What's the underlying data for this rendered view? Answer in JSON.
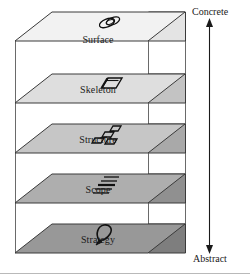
{
  "diagram": {
    "axis": {
      "top_label": "Concrete",
      "bottom_label": "Abstract",
      "name": "concrete-abstract-axis"
    },
    "layers": [
      {
        "id": "surface",
        "label": "Surface",
        "icon": "overlapping-rings-icon",
        "fill": "#f2f2f2",
        "label_x": 98,
        "label_y": 41
      },
      {
        "id": "skeleton",
        "label": "Skeleton",
        "icon": "wireframe-box-icon",
        "fill": "#dedede",
        "label_x": 98,
        "label_y": 91
      },
      {
        "id": "structure",
        "label": "Structure",
        "icon": "node-network-icon",
        "fill": "#c6c6c6",
        "label_x": 98,
        "label_y": 141
      },
      {
        "id": "scope",
        "label": "Scope",
        "icon": "feature-list-icon",
        "fill": "#aeaeae",
        "label_x": 98,
        "label_y": 191
      },
      {
        "id": "strategy",
        "label": "Strategy",
        "icon": "balloon-idea-icon",
        "fill": "#989898",
        "label_x": 98,
        "label_y": 241
      }
    ],
    "colors": {
      "stroke": "#3a3a3a",
      "text": "#1a1a1a",
      "frame": "#5a5a5a",
      "rule": "#b9b9b9"
    }
  }
}
